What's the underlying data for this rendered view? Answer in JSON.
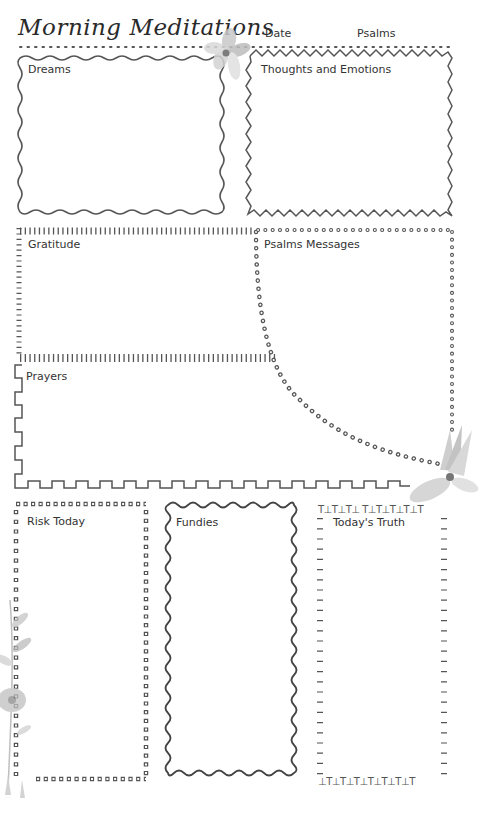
{
  "page": {
    "title": "Morning Meditations",
    "header_fields": {
      "date_label": "Date",
      "psalms_label": "Psalms"
    }
  },
  "sections": {
    "dreams": {
      "label": "Dreams"
    },
    "thoughts": {
      "label": "Thoughts and Emotions"
    },
    "gratitude": {
      "label": "Gratitude"
    },
    "psalms_messages": {
      "label": "Psalms Messages"
    },
    "prayers": {
      "label": "Prayers"
    },
    "risk_today": {
      "label": "Risk Today"
    },
    "fundies": {
      "label": "Fundies"
    },
    "todays_truth": {
      "label": "Today's Truth"
    }
  },
  "decorations": {
    "top_flower": "watercolor-flower-icon",
    "middle_right_flower": "watercolor-flower-icon",
    "bottom_left_foliage": "watercolor-foliage-icon"
  },
  "colors": {
    "ink": "#3a3a3a",
    "flower": "#b8b8b8",
    "background": "#ffffff"
  }
}
